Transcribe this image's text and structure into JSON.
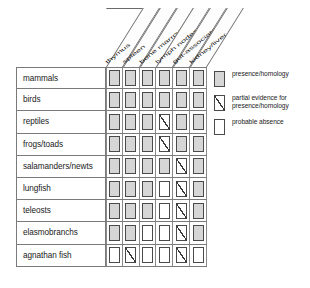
{
  "figure": {
    "columns": [
      {
        "key": "thymus",
        "label": "thymus"
      },
      {
        "key": "spleen",
        "label": "spleen"
      },
      {
        "key": "bone_marrow",
        "label": "bone marrow"
      },
      {
        "key": "lymph_nodes",
        "label": "lymph nodes"
      },
      {
        "key": "gut_associated",
        "label": "gut-associated"
      },
      {
        "key": "kidney_liver",
        "label": "kidney/liver"
      }
    ],
    "rows": [
      {
        "label": "mammals",
        "cells": [
          "present",
          "present",
          "present",
          "present",
          "present",
          "present"
        ]
      },
      {
        "label": "birds",
        "cells": [
          "present",
          "present",
          "present",
          "present",
          "present",
          "present"
        ]
      },
      {
        "label": "reptiles",
        "cells": [
          "present",
          "present",
          "present",
          "partial",
          "present",
          "present"
        ]
      },
      {
        "label": "frogs/toads",
        "cells": [
          "present",
          "present",
          "present",
          "partial",
          "present",
          "present"
        ]
      },
      {
        "label": "salamanders/newts",
        "cells": [
          "present",
          "present",
          "present",
          "present",
          "partial",
          "present"
        ]
      },
      {
        "label": "lungfish",
        "cells": [
          "present",
          "present",
          "present",
          "absent",
          "partial",
          "present"
        ]
      },
      {
        "label": "teleosts",
        "cells": [
          "present",
          "present",
          "present",
          "absent",
          "partial",
          "present"
        ]
      },
      {
        "label": "elasmobranchs",
        "cells": [
          "present",
          "present",
          "absent",
          "absent",
          "partial",
          "present"
        ]
      },
      {
        "label": "agnathan fish",
        "cells": [
          "absent",
          "partial",
          "absent",
          "absent",
          "partial",
          "absent"
        ]
      }
    ],
    "legend": [
      {
        "state": "present",
        "text": "presence/homology"
      },
      {
        "state": "partial",
        "text": "partial evidence for presence/homology"
      },
      {
        "state": "absent",
        "text": "probable absence"
      }
    ],
    "colors": {
      "present_fill": "#d6d6d6",
      "absent_fill": "#ffffff",
      "line": "#4a4a4a",
      "background": "#ffffff"
    }
  }
}
